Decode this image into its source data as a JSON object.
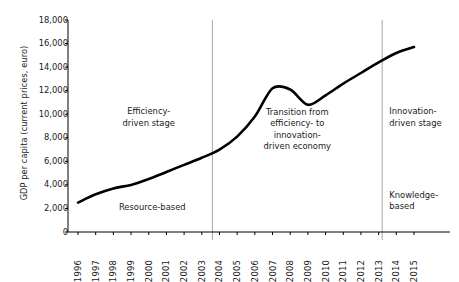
{
  "chart_data": {
    "type": "line",
    "title": "",
    "xlabel": "",
    "ylabel": "GDP per capita (current prices, euro)",
    "x": [
      1996,
      1997,
      1998,
      1999,
      2000,
      2001,
      2002,
      2003,
      2004,
      2005,
      2006,
      2007,
      2008,
      2009,
      2010,
      2011,
      2012,
      2013,
      2014,
      2015
    ],
    "categories": [
      "1996",
      "1997",
      "1998",
      "1999",
      "2000",
      "2001",
      "2002",
      "2003",
      "2004",
      "2005",
      "2006",
      "2007",
      "2008",
      "2009",
      "2010",
      "2011",
      "2012",
      "2013",
      "2014",
      "2015"
    ],
    "values": [
      2500,
      3200,
      3700,
      4000,
      4500,
      5100,
      5700,
      6300,
      7000,
      8100,
      9800,
      12200,
      12100,
      10800,
      11600,
      12600,
      13500,
      14400,
      15200,
      15700
    ],
    "series": [
      {
        "name": "GDP per capita",
        "values": [
          2500,
          3200,
          3700,
          4000,
          4500,
          5100,
          5700,
          6300,
          7000,
          8100,
          9800,
          12200,
          12100,
          10800,
          11600,
          12600,
          13500,
          14400,
          15200,
          15700
        ],
        "color": "#000000",
        "line_width": 2.6
      }
    ],
    "xlim": [
      1996,
      2015
    ],
    "ylim": [
      0,
      18000
    ],
    "yticks": [
      0,
      2000,
      4000,
      6000,
      8000,
      10000,
      12000,
      14000,
      16000,
      18000
    ],
    "ytick_labels": [
      "0",
      "2,000",
      "4,000",
      "6,000",
      "8,000",
      "10,000",
      "12,000",
      "14,000",
      "16,000",
      "18,000"
    ],
    "grid": false,
    "legend": "none",
    "vertical_dividers": [
      {
        "name": "divider-2004",
        "x_value": 2003.6,
        "color": "#a6a6a6"
      },
      {
        "name": "divider-2013",
        "x_value": 2013.2,
        "color": "#a6a6a6"
      }
    ],
    "annotations": [
      {
        "name": "efficiency-driven-stage",
        "text": "Efficiency-\ndriven stage",
        "x_value": 2000.0,
        "y_value": 9700
      },
      {
        "name": "resource-based",
        "text": "Resource-based",
        "x_value": 2000.2,
        "y_value": 2100
      },
      {
        "name": "transition-economy",
        "text": "Transition from\nefficiency- to\ninnovation-\ndriven economy",
        "x_value": 2008.4,
        "y_value": 8700
      },
      {
        "name": "innovation-driven-stage",
        "text": "Innovation-\ndriven stage",
        "x_value": 2013.6,
        "y_value": 9700
      },
      {
        "name": "knowledge-based",
        "text": "Knowledge-\nbased",
        "x_value": 2013.6,
        "y_value": 2600
      }
    ]
  },
  "axes": {
    "axis_color": "#000000",
    "tick_color": "#000000"
  }
}
